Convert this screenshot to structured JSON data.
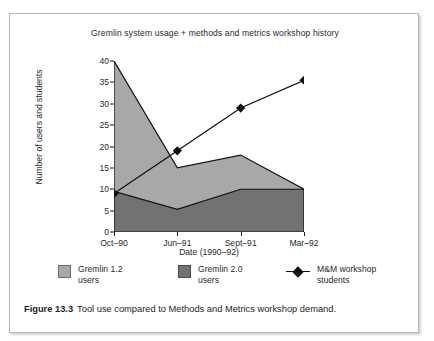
{
  "figure": {
    "caption_number": "Figure 13.3",
    "caption_text": "Tool use compared to Methods and Metrics workshop demand."
  },
  "chart_data": {
    "type": "area",
    "title": "Gremlin system usage + methods and metrics workshop history",
    "xlabel": "Date (1990–92)",
    "ylabel": "Number of users and students",
    "categories": [
      "Oct–90",
      "Jun–91",
      "Sept–91",
      "Mar–92"
    ],
    "ylim": [
      0,
      40
    ],
    "yticks": [
      0,
      5,
      10,
      15,
      20,
      25,
      30,
      35,
      40
    ],
    "ytick_labels": [
      "0",
      "5",
      "10",
      "15",
      "20",
      "25",
      "30",
      "35",
      "40"
    ],
    "grid": false,
    "legend_position": "bottom",
    "stacked": false,
    "series": [
      {
        "name": "Gremlin 1.2 users",
        "legend_label": "Gremlin 1.2\nusers",
        "type": "area",
        "color": "#a8a8a8",
        "note": "upper boundary of light area = total users",
        "values": [
          40,
          15,
          18,
          10
        ]
      },
      {
        "name": "Gremlin 2.0 users",
        "legend_label": "Gremlin 2.0\nusers",
        "type": "area",
        "color": "#727272",
        "values": [
          9.5,
          5.3,
          10,
          10
        ]
      },
      {
        "name": "M&M workshop students",
        "legend_label": "M&M workshop\nstudents",
        "type": "line",
        "color": "#111111",
        "marker": "diamond",
        "values": [
          9,
          19,
          29,
          35.5
        ]
      }
    ]
  }
}
